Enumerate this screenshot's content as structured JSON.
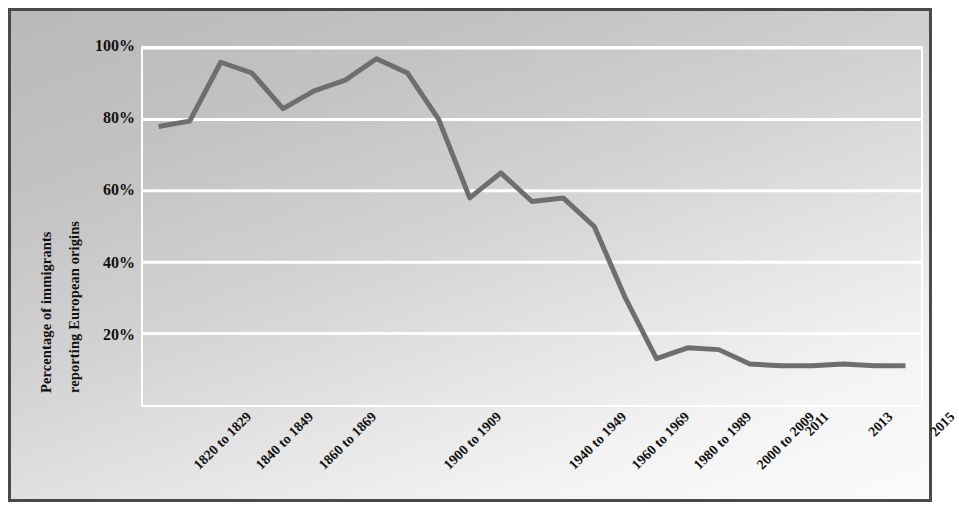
{
  "chart_data": {
    "type": "line",
    "title": "",
    "xlabel": "",
    "ylabel": "Percentage of immigrants reporting European origins",
    "ylabel_lines": [
      "Percentage of immigrants",
      "reporting European origins"
    ],
    "ylim": [
      0,
      100
    ],
    "ytick_values": [
      20,
      40,
      60,
      80,
      100
    ],
    "ytick_labels": [
      "20%",
      "40%",
      "60%",
      "80%",
      "100%"
    ],
    "grid": "horizontal",
    "gridline_color": "#ffffff",
    "line_color": "#6e6e6e",
    "line_width": 5,
    "legend": "none",
    "plot_background": "gradient-gray",
    "categories": [
      "1820 to 1829",
      "1830 to 1839",
      "1840 to 1849",
      "1850 to 1859",
      "1860 to 1869",
      "1870 to 1879",
      "1880 to 1889",
      "1890 to 1899",
      "1900 to 1909",
      "1910 to 1919",
      "1920 to 1929",
      "1930 to 1939",
      "1940 to 1949",
      "1950 to 1959",
      "1960 to 1969",
      "1970 to 1979",
      "1980 to 1989",
      "1990 to 1999",
      "2000 to 2009",
      "2010",
      "2011",
      "2012",
      "2013",
      "2014",
      "2015"
    ],
    "visible_tick_labels": [
      "1820 to 1829",
      "1840 to 1849",
      "1860 to 1869",
      "1900 to 1909",
      "1940 to 1949",
      "1960 to 1969",
      "1980 to 1989",
      "2000 to 2009",
      "2011",
      "2013",
      "2015"
    ],
    "values": [
      78,
      79.5,
      96,
      93,
      83,
      88,
      91,
      97,
      93,
      80,
      58,
      65,
      57,
      58,
      50,
      30,
      13,
      16,
      15.5,
      11.5,
      11,
      11,
      11.5,
      11,
      11
    ],
    "series": [
      {
        "name": "Percentage of immigrants reporting European origins",
        "values": [
          78,
          79.5,
          96,
          93,
          83,
          88,
          91,
          97,
          93,
          80,
          58,
          65,
          57,
          58,
          50,
          30,
          13,
          16,
          15.5,
          11.5,
          11,
          11,
          11.5,
          11,
          11
        ]
      }
    ]
  },
  "axis": {
    "y_title_line1": "Percentage of immigrants",
    "y_title_line2": "reporting European origins"
  }
}
